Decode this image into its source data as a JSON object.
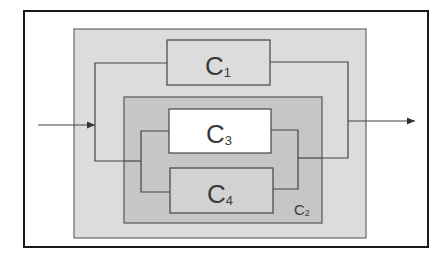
{
  "diagram": {
    "type": "block-diagram",
    "frame": {
      "x": 24,
      "y": 11,
      "w": 404,
      "h": 236
    },
    "outer_box": {
      "x": 74,
      "y": 29,
      "w": 292,
      "h": 209,
      "fill": "#dcdcdc"
    },
    "components": [
      {
        "id": "C1",
        "label_main": "C",
        "label_sub": "1",
        "x": 167,
        "y": 40,
        "w": 103,
        "h": 45,
        "fill": "#dcdcdc"
      },
      {
        "id": "C2",
        "label_main": "C",
        "label_sub": "2",
        "x": 124,
        "y": 97,
        "w": 198,
        "h": 126,
        "fill": "#c6c6c6",
        "is_container": true
      },
      {
        "id": "C3",
        "label_main": "C",
        "label_sub": "3",
        "x": 169,
        "y": 109,
        "w": 102,
        "h": 44,
        "fill": "#ffffff"
      },
      {
        "id": "C4",
        "label_main": "C",
        "label_sub": "4",
        "x": 170,
        "y": 168,
        "w": 103,
        "h": 45,
        "fill": "#d2d2d2"
      }
    ],
    "input_arrow": {
      "x1": 38,
      "y1": 125,
      "x2": 95,
      "y2": 125
    },
    "output_arrow": {
      "x1": 348,
      "y1": 121,
      "x2": 415,
      "y2": 121
    },
    "colors": {
      "line": "#444444",
      "frame": "#1a1a1a",
      "text": "#3a3a3a"
    }
  }
}
